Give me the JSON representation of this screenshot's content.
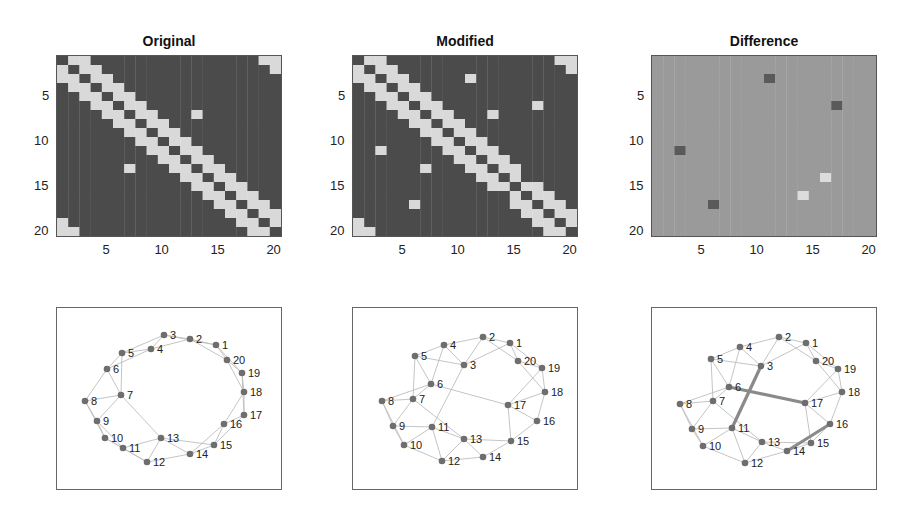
{
  "chart_data": [
    {
      "type": "heatmap",
      "title": "Original",
      "description": "20x20 adjacency matrix of a ring lattice (each node linked to 2 neighbors on each side) plus one extra edge 7-13",
      "n": 20,
      "xticks": [
        5,
        10,
        15,
        20
      ],
      "yticks": [
        5,
        10,
        15,
        20
      ],
      "base": "ring_k2",
      "extra_edges": [
        [
          7,
          13
        ]
      ],
      "removed_edges": []
    },
    {
      "type": "heatmap",
      "title": "Modified",
      "description": "Original adjacency with edges 3-11 and 6-17 added and edge 14-16 removed",
      "n": 20,
      "xticks": [
        5,
        10,
        15,
        20
      ],
      "yticks": [
        5,
        10,
        15,
        20
      ],
      "base": "ring_k2",
      "extra_edges": [
        [
          7,
          13
        ],
        [
          3,
          11
        ],
        [
          6,
          17
        ]
      ],
      "removed_edges": [
        [
          14,
          16
        ]
      ]
    },
    {
      "type": "heatmap",
      "title": "Difference",
      "description": "Original minus Modified; dark = added edge, light = removed edge, mid-gray = unchanged",
      "n": 20,
      "xticks": [
        5,
        10,
        15,
        20
      ],
      "yticks": [
        5,
        10,
        15,
        20
      ],
      "cells_dark": [
        [
          3,
          11
        ],
        [
          11,
          3
        ],
        [
          6,
          17
        ],
        [
          17,
          6
        ]
      ],
      "cells_light": [
        [
          14,
          16
        ],
        [
          16,
          14
        ]
      ]
    },
    {
      "type": "network",
      "title": "Original graph",
      "nodes": [
        {
          "id": 1,
          "x": 216,
          "y": 345
        },
        {
          "id": 2,
          "x": 190,
          "y": 339
        },
        {
          "id": 3,
          "x": 164,
          "y": 335
        },
        {
          "id": 4,
          "x": 151,
          "y": 349
        },
        {
          "id": 5,
          "x": 122,
          "y": 353
        },
        {
          "id": 6,
          "x": 107,
          "y": 369
        },
        {
          "id": 7,
          "x": 121,
          "y": 395
        },
        {
          "id": 8,
          "x": 85,
          "y": 401
        },
        {
          "id": 9,
          "x": 97,
          "y": 421
        },
        {
          "id": 10,
          "x": 105,
          "y": 438
        },
        {
          "id": 11,
          "x": 123,
          "y": 448
        },
        {
          "id": 12,
          "x": 147,
          "y": 462
        },
        {
          "id": 13,
          "x": 161,
          "y": 438
        },
        {
          "id": 14,
          "x": 190,
          "y": 454
        },
        {
          "id": 15,
          "x": 214,
          "y": 445
        },
        {
          "id": 16,
          "x": 224,
          "y": 424
        },
        {
          "id": 17,
          "x": 244,
          "y": 415
        },
        {
          "id": 18,
          "x": 244,
          "y": 392
        },
        {
          "id": 19,
          "x": 242,
          "y": 373
        },
        {
          "id": 20,
          "x": 227,
          "y": 360
        }
      ],
      "highlight_edges": []
    },
    {
      "type": "network",
      "title": "Modified graph",
      "nodes": [
        {
          "id": 1,
          "x": 510,
          "y": 343
        },
        {
          "id": 2,
          "x": 483,
          "y": 337
        },
        {
          "id": 3,
          "x": 464,
          "y": 365
        },
        {
          "id": 4,
          "x": 444,
          "y": 345
        },
        {
          "id": 5,
          "x": 415,
          "y": 356
        },
        {
          "id": 6,
          "x": 431,
          "y": 384
        },
        {
          "id": 7,
          "x": 413,
          "y": 399
        },
        {
          "id": 8,
          "x": 382,
          "y": 401
        },
        {
          "id": 9,
          "x": 393,
          "y": 426
        },
        {
          "id": 10,
          "x": 404,
          "y": 445
        },
        {
          "id": 11,
          "x": 432,
          "y": 427
        },
        {
          "id": 12,
          "x": 442,
          "y": 461
        },
        {
          "id": 13,
          "x": 464,
          "y": 439
        },
        {
          "id": 14,
          "x": 483,
          "y": 457
        },
        {
          "id": 15,
          "x": 511,
          "y": 441
        },
        {
          "id": 16,
          "x": 537,
          "y": 421
        },
        {
          "id": 17,
          "x": 508,
          "y": 405
        },
        {
          "id": 18,
          "x": 545,
          "y": 392
        },
        {
          "id": 19,
          "x": 542,
          "y": 368
        },
        {
          "id": 20,
          "x": 518,
          "y": 361
        }
      ],
      "highlight_edges": []
    },
    {
      "type": "network",
      "title": "Difference graph",
      "nodes": [
        {
          "id": 1,
          "x": 806,
          "y": 343
        },
        {
          "id": 2,
          "x": 779,
          "y": 337
        },
        {
          "id": 3,
          "x": 761,
          "y": 366
        },
        {
          "id": 4,
          "x": 740,
          "y": 347
        },
        {
          "id": 5,
          "x": 711,
          "y": 359
        },
        {
          "id": 6,
          "x": 729,
          "y": 387
        },
        {
          "id": 7,
          "x": 713,
          "y": 401
        },
        {
          "id": 8,
          "x": 680,
          "y": 404
        },
        {
          "id": 9,
          "x": 692,
          "y": 429
        },
        {
          "id": 10,
          "x": 703,
          "y": 446
        },
        {
          "id": 11,
          "x": 732,
          "y": 428
        },
        {
          "id": 12,
          "x": 745,
          "y": 463
        },
        {
          "id": 13,
          "x": 762,
          "y": 442
        },
        {
          "id": 14,
          "x": 787,
          "y": 451
        },
        {
          "id": 15,
          "x": 811,
          "y": 443
        },
        {
          "id": 16,
          "x": 830,
          "y": 424
        },
        {
          "id": 17,
          "x": 805,
          "y": 403
        },
        {
          "id": 18,
          "x": 842,
          "y": 392
        },
        {
          "id": 19,
          "x": 838,
          "y": 369
        },
        {
          "id": 20,
          "x": 816,
          "y": 361
        }
      ],
      "highlight_edges": [
        [
          3,
          11
        ],
        [
          6,
          17
        ],
        [
          14,
          16
        ]
      ]
    }
  ],
  "titles": {
    "original": "Original",
    "modified": "Modified",
    "difference": "Difference"
  },
  "ticks": [
    "5",
    "10",
    "15",
    "20"
  ],
  "colors": {
    "dark": "#4b4b4b",
    "light": "#d9d9d9",
    "mid": "#9a9a9a",
    "diff_dark": "#5a5a5a",
    "diff_light": "#dcdcdc",
    "edge": "#bdbdbd",
    "node": "#6e6e6e",
    "highlight": "#8a8a8a"
  }
}
